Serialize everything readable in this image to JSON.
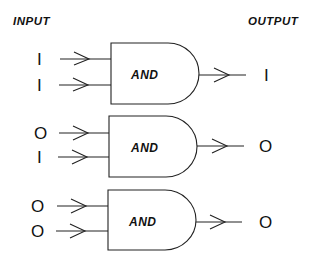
{
  "headers": {
    "input": "INPUT",
    "output": "OUTPUT"
  },
  "gate_type": "AND",
  "gates": [
    {
      "label": "AND",
      "inputs": [
        "I",
        "I"
      ],
      "output": "I"
    },
    {
      "label": "AND",
      "inputs": [
        "O",
        "I"
      ],
      "output": "O"
    },
    {
      "label": "AND",
      "inputs": [
        "O",
        "O"
      ],
      "output": "O"
    }
  ]
}
